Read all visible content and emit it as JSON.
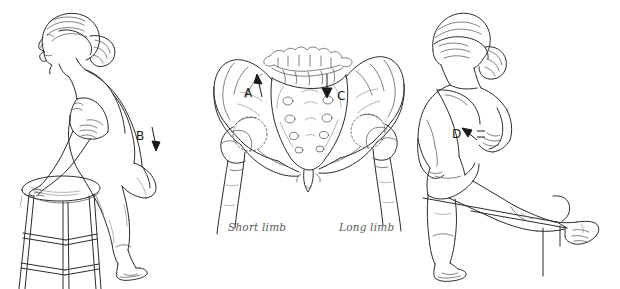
{
  "figure": {
    "background_color": "#ffffff",
    "ink_color": "#2b2b2b",
    "caption_color": "#5d5d5d",
    "panel_count": 3
  },
  "panels": [
    {
      "id": "panel-left",
      "name": "standing-lean-on-stool",
      "description": "Side view of a standing woman leaning forward with arms folded, one foot resting on a round stool",
      "marker": {
        "label": "B",
        "arrow": "down-arrow",
        "x": 142,
        "y": 138
      },
      "objects": [
        "figure-side-view",
        "stool",
        "folded-arms",
        "ponytail"
      ]
    },
    {
      "id": "panel-center",
      "name": "pelvis-anteroposterior",
      "description": "Anteroposterior skeletal drawing of the pelvis, sacrum, lumbar vertebrae and proximal femurs showing pelvic obliquity",
      "markers": [
        {
          "label": "A",
          "arrow": "up-arrow",
          "x": 248,
          "y": 93
        },
        {
          "label": "C",
          "arrow": "down-arrow",
          "x": 330,
          "y": 96
        }
      ],
      "captions": [
        {
          "id": "caption-short",
          "text": "Short limb",
          "side": "left"
        },
        {
          "id": "caption-long",
          "text": "Long limb",
          "side": "right"
        }
      ],
      "objects": [
        "lumbar-vertebrae",
        "sacrum",
        "left-ilium",
        "right-ilium",
        "femoral-head",
        "femur"
      ]
    },
    {
      "id": "panel-right",
      "name": "rear-view-leg-on-table",
      "description": "Rear view of a standing woman with one leg extended and resting on a table edge, hand on hip",
      "marker": {
        "label": "D",
        "arrow": "up-left-arrow",
        "x": 458,
        "y": 133
      },
      "objects": [
        "figure-rear-view",
        "table",
        "raised-leg",
        "hand-on-hip",
        "ponytail"
      ]
    }
  ],
  "labels": {
    "a": "A",
    "b": "B",
    "c": "C",
    "d": "D",
    "short_limb": "Short limb",
    "long_limb": "Long limb"
  },
  "icons": {
    "up_arrow": "up-arrow-icon",
    "down_arrow": "down-arrow-icon",
    "diagonal_arrow": "diagonal-arrow-icon"
  }
}
